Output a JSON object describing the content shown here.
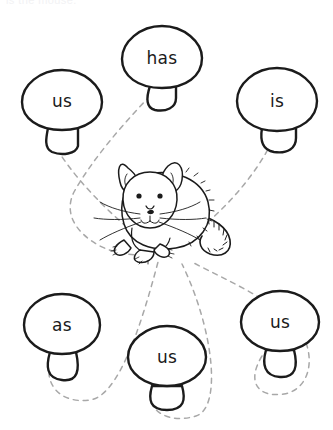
{
  "worksheet": {
    "title_partial": "is the mouse.",
    "background_color": "#ffffff",
    "ink_color": "#1b1b1b",
    "dash_color": "#a8a8a8",
    "width": 333,
    "height": 430
  },
  "center_figure": {
    "name": "mouse",
    "label": "mouse-illustration",
    "x": 168,
    "y": 210
  },
  "mushrooms": [
    {
      "id": "mushroom-us-top-left",
      "word": "us",
      "cap_cx": 62,
      "cap_cy": 101,
      "cap_rx": 40,
      "cap_ry": 32,
      "label_x": 62,
      "label_y": 101
    },
    {
      "id": "mushroom-has-top-center",
      "word": "has",
      "cap_cx": 162,
      "cap_cy": 58,
      "cap_rx": 40,
      "cap_ry": 33,
      "label_x": 162,
      "label_y": 58
    },
    {
      "id": "mushroom-is-top-right",
      "word": "is",
      "cap_cx": 277,
      "cap_cy": 101,
      "cap_rx": 40,
      "cap_ry": 33,
      "label_x": 277,
      "label_y": 101
    },
    {
      "id": "mushroom-as-bottom-left",
      "word": "as",
      "cap_cx": 62,
      "cap_cy": 325,
      "cap_rx": 38,
      "cap_ry": 31,
      "label_x": 62,
      "label_y": 325
    },
    {
      "id": "mushroom-us-bottom-center",
      "word": "us",
      "cap_cx": 167,
      "cap_cy": 357,
      "cap_rx": 39,
      "cap_ry": 31,
      "label_x": 167,
      "label_y": 357
    },
    {
      "id": "mushroom-us-bottom-right",
      "word": "us",
      "cap_cx": 280,
      "cap_cy": 322,
      "cap_rx": 39,
      "cap_ry": 31,
      "label_x": 280,
      "label_y": 322
    }
  ],
  "connectors": [
    {
      "id": "connector-us-top-left",
      "from": "mushroom-us-top-left",
      "to": "mouse"
    },
    {
      "id": "connector-has-top-center",
      "from": "mushroom-has-top-center",
      "to": "mouse"
    },
    {
      "id": "connector-is-top-right",
      "from": "mushroom-is-top-right",
      "to": "mouse"
    },
    {
      "id": "connector-as-bottom-left",
      "from": "mushroom-as-bottom-left",
      "to": "mouse"
    },
    {
      "id": "connector-us-bottom-center",
      "from": "mushroom-us-bottom-center",
      "to": "mouse"
    },
    {
      "id": "connector-us-bottom-right",
      "from": "mushroom-us-bottom-right",
      "to": "mouse"
    }
  ]
}
